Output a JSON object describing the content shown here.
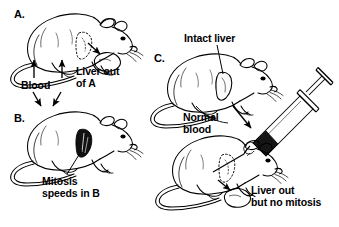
{
  "figure": {
    "title_visible": false,
    "background_color": "#ffffff",
    "ink_color": "#000000"
  },
  "panels": [
    {
      "id": "A",
      "letter": "A.",
      "description": "rat with liver removed",
      "liver_state": "removed"
    },
    {
      "id": "B",
      "letter": "B.",
      "description": "rat with dark shaded liver undergoing mitosis",
      "liver_state": "dark-filled"
    },
    {
      "id": "C",
      "letter": "C.",
      "description": "rat with intact liver receiving normal blood, plus second rat with liver removed",
      "liver_state": "intact"
    }
  ],
  "labels": {
    "blood": "Blood",
    "liver_out_of_a": "Liver out\nof A",
    "mitosis_speeds_in_b": "Mitosis\nspeeds in B",
    "intact_liver": "Intact liver",
    "normal_blood": "Normal\nblood",
    "liver_out_but_no_mitosis": "Liver out\nbut no mitosis"
  },
  "objects": {
    "syringe": "syringe-with-dark-contents",
    "excised_liver_a": "excised-liver-lobe",
    "excised_liver_c": "excised-liver-lobe"
  }
}
